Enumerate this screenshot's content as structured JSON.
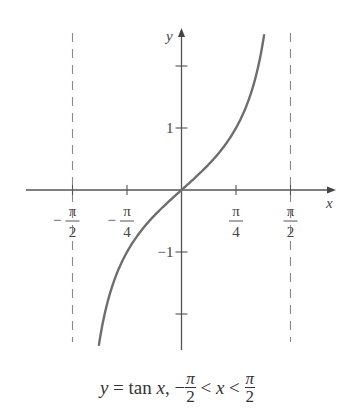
{
  "chart_data": {
    "type": "line",
    "title": "",
    "caption": "y = tan x, −π/2 < x < π/2",
    "xlabel": "x",
    "ylabel": "y",
    "xlim": [
      -1.6,
      2.4
    ],
    "ylim": [
      -2.6,
      2.6
    ],
    "grid": false,
    "x_ticks": [
      {
        "value": -1.5708,
        "label_num": "π",
        "label_den": "2",
        "sign": "−"
      },
      {
        "value": -0.7854,
        "label_num": "π",
        "label_den": "4",
        "sign": "−"
      },
      {
        "value": 0.7854,
        "label_num": "π",
        "label_den": "4",
        "sign": ""
      },
      {
        "value": 1.5708,
        "label_num": "π",
        "label_den": "2",
        "sign": ""
      }
    ],
    "y_ticks": [
      {
        "value": 2,
        "label": ""
      },
      {
        "value": 1,
        "label": "1"
      },
      {
        "value": -1,
        "label": "−1"
      },
      {
        "value": -2,
        "label": ""
      }
    ],
    "asymptotes": [
      -1.5708,
      1.5708
    ],
    "series": [
      {
        "name": "tan x",
        "color": "#6e6e6e",
        "x": [
          -1.19,
          -1.1,
          -1.0,
          -0.9,
          -0.8,
          -0.7,
          -0.6,
          -0.5,
          -0.4,
          -0.3,
          -0.2,
          -0.1,
          0.0,
          0.1,
          0.2,
          0.3,
          0.4,
          0.5,
          0.6,
          0.7,
          0.8,
          0.9,
          1.0,
          1.1,
          1.19
        ],
        "y": [
          -2.49,
          -1.96,
          -1.56,
          -1.26,
          -1.03,
          -0.84,
          -0.68,
          -0.55,
          -0.42,
          -0.31,
          -0.2,
          -0.1,
          0.0,
          0.1,
          0.2,
          0.31,
          0.42,
          0.55,
          0.68,
          0.84,
          1.03,
          1.26,
          1.56,
          1.96,
          2.49
        ]
      }
    ]
  },
  "labels": {
    "x_axis": "x",
    "y_axis": "y",
    "caption_y": "y",
    "caption_eq": " = tan ",
    "caption_x": "x",
    "caption_comma": ", −",
    "caption_pi": "π",
    "caption_two": "2",
    "caption_lt": " < ",
    "caption_x2": "x",
    "caption_lt2": " < "
  },
  "colors": {
    "axis": "#555555",
    "curve": "#6e6e6e",
    "asymptote": "#888888",
    "text": "#444444"
  }
}
